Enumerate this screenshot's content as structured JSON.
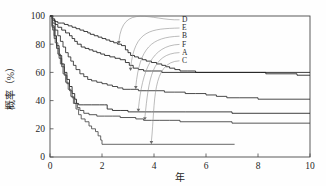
{
  "chart_data": {
    "type": "line",
    "title": "",
    "subtitle": "",
    "xlabel": "年",
    "ylabel": "概率（%）",
    "xlim": [
      0,
      10
    ],
    "ylim": [
      0,
      100
    ],
    "xticks": [
      0,
      2,
      4,
      6,
      8,
      10
    ],
    "yticks": [
      0,
      20,
      40,
      60,
      80,
      100
    ],
    "xtick_labels": [
      "0",
      "2",
      "4",
      "6",
      "8",
      "10"
    ],
    "ytick_labels": [
      "0",
      "20",
      "40",
      "60",
      "80",
      "100"
    ],
    "grid": false,
    "legend_position": "inside-upper-right",
    "legend_style": "curved-leader-lines-to-curves",
    "legend_entries": [
      {
        "label": "D",
        "anchor_x": 2.65,
        "anchor_y": 80
      },
      {
        "label": "E",
        "anchor_x": 3.1,
        "anchor_y": 61
      },
      {
        "label": "B",
        "anchor_x": 3.3,
        "anchor_y": 48
      },
      {
        "label": "F",
        "anchor_x": 3.4,
        "anchor_y": 32
      },
      {
        "label": "A",
        "anchor_x": 3.65,
        "anchor_y": 26
      },
      {
        "label": "C",
        "anchor_x": 3.9,
        "anchor_y": 9
      }
    ],
    "series": [
      {
        "name": "D",
        "final_value": 58,
        "points": [
          [
            0,
            100
          ],
          [
            0.08,
            98
          ],
          [
            0.18,
            96
          ],
          [
            0.3,
            95
          ],
          [
            0.45,
            95
          ],
          [
            0.55,
            94
          ],
          [
            0.7,
            93
          ],
          [
            0.85,
            92
          ],
          [
            1.0,
            91
          ],
          [
            1.15,
            90
          ],
          [
            1.3,
            89
          ],
          [
            1.45,
            88
          ],
          [
            1.55,
            87
          ],
          [
            1.7,
            86
          ],
          [
            1.85,
            85
          ],
          [
            2.0,
            84
          ],
          [
            2.15,
            83
          ],
          [
            2.3,
            82
          ],
          [
            2.45,
            81
          ],
          [
            2.6,
            80
          ],
          [
            2.75,
            79
          ],
          [
            2.9,
            76
          ],
          [
            3.0,
            74
          ],
          [
            3.1,
            72
          ],
          [
            3.25,
            71
          ],
          [
            3.4,
            70
          ],
          [
            3.55,
            69
          ],
          [
            3.7,
            68
          ],
          [
            3.9,
            67
          ],
          [
            4.1,
            66
          ],
          [
            4.3,
            65
          ],
          [
            4.45,
            64
          ],
          [
            4.6,
            63
          ],
          [
            4.8,
            62
          ],
          [
            5.0,
            61
          ],
          [
            5.3,
            61
          ],
          [
            5.6,
            60
          ],
          [
            6.0,
            60
          ],
          [
            6.5,
            60
          ],
          [
            7.0,
            60
          ],
          [
            7.5,
            60
          ],
          [
            8.1,
            60
          ],
          [
            8.3,
            59
          ],
          [
            9.0,
            59
          ],
          [
            9.5,
            58
          ],
          [
            10,
            58
          ]
        ]
      },
      {
        "name": "E",
        "final_value": 60,
        "points": [
          [
            0,
            100
          ],
          [
            0.1,
            97
          ],
          [
            0.2,
            94
          ],
          [
            0.3,
            92
          ],
          [
            0.45,
            90
          ],
          [
            0.6,
            88
          ],
          [
            0.75,
            86
          ],
          [
            0.85,
            84
          ],
          [
            0.95,
            82
          ],
          [
            1.05,
            80
          ],
          [
            1.2,
            78
          ],
          [
            1.35,
            77
          ],
          [
            1.5,
            76
          ],
          [
            1.65,
            75
          ],
          [
            1.8,
            74
          ],
          [
            1.95,
            73
          ],
          [
            2.1,
            72
          ],
          [
            2.3,
            71
          ],
          [
            2.5,
            70
          ],
          [
            2.7,
            69
          ],
          [
            2.9,
            67
          ],
          [
            3.05,
            65
          ],
          [
            3.2,
            63
          ],
          [
            3.4,
            62
          ],
          [
            3.6,
            61
          ],
          [
            3.9,
            61
          ],
          [
            4.3,
            60
          ],
          [
            5.0,
            60
          ],
          [
            6.0,
            60
          ],
          [
            7.0,
            60
          ],
          [
            8.0,
            60
          ],
          [
            9.0,
            60
          ],
          [
            10,
            60
          ]
        ]
      },
      {
        "name": "B",
        "final_value": 41,
        "points": [
          [
            0,
            100
          ],
          [
            0.1,
            95
          ],
          [
            0.2,
            90
          ],
          [
            0.3,
            86
          ],
          [
            0.4,
            82
          ],
          [
            0.5,
            78
          ],
          [
            0.6,
            74
          ],
          [
            0.7,
            71
          ],
          [
            0.8,
            68
          ],
          [
            0.9,
            65
          ],
          [
            1.0,
            62
          ],
          [
            1.15,
            59
          ],
          [
            1.3,
            57
          ],
          [
            1.45,
            55
          ],
          [
            1.6,
            54
          ],
          [
            1.8,
            53
          ],
          [
            2.0,
            52
          ],
          [
            2.2,
            51
          ],
          [
            2.4,
            50
          ],
          [
            2.6,
            49
          ],
          [
            2.8,
            48
          ],
          [
            3.1,
            48
          ],
          [
            3.4,
            47
          ],
          [
            3.7,
            47
          ],
          [
            4.0,
            47
          ],
          [
            4.4,
            46
          ],
          [
            4.8,
            46
          ],
          [
            5.2,
            45
          ],
          [
            5.6,
            45
          ],
          [
            6.0,
            44
          ],
          [
            6.4,
            43
          ],
          [
            6.8,
            42
          ],
          [
            7.3,
            42
          ],
          [
            8.0,
            41
          ],
          [
            9.0,
            41
          ],
          [
            10,
            41
          ]
        ]
      },
      {
        "name": "F",
        "final_value": 31,
        "points": [
          [
            0,
            100
          ],
          [
            0.08,
            93
          ],
          [
            0.16,
            86
          ],
          [
            0.25,
            79
          ],
          [
            0.35,
            72
          ],
          [
            0.45,
            66
          ],
          [
            0.55,
            60
          ],
          [
            0.65,
            55
          ],
          [
            0.75,
            50
          ],
          [
            0.85,
            45
          ],
          [
            0.95,
            41
          ],
          [
            1.02,
            38
          ],
          [
            1.1,
            37
          ],
          [
            1.3,
            37
          ],
          [
            1.6,
            37
          ],
          [
            1.9,
            37
          ],
          [
            2.1,
            37
          ],
          [
            2.2,
            34
          ],
          [
            2.4,
            33
          ],
          [
            2.7,
            33
          ],
          [
            3.0,
            32
          ],
          [
            3.4,
            32
          ],
          [
            3.9,
            32
          ],
          [
            4.5,
            32
          ],
          [
            5.2,
            32
          ],
          [
            6.0,
            32
          ],
          [
            7.0,
            31
          ],
          [
            8.0,
            31
          ],
          [
            9.0,
            31
          ],
          [
            10,
            31
          ]
        ]
      },
      {
        "name": "A",
        "final_value": 24,
        "points": [
          [
            0,
            100
          ],
          [
            0.08,
            92
          ],
          [
            0.16,
            84
          ],
          [
            0.25,
            77
          ],
          [
            0.35,
            70
          ],
          [
            0.45,
            64
          ],
          [
            0.55,
            58
          ],
          [
            0.65,
            52
          ],
          [
            0.75,
            47
          ],
          [
            0.85,
            42
          ],
          [
            0.95,
            38
          ],
          [
            1.05,
            35
          ],
          [
            1.15,
            33
          ],
          [
            1.3,
            31
          ],
          [
            1.5,
            30
          ],
          [
            1.8,
            29
          ],
          [
            2.1,
            29
          ],
          [
            2.4,
            29
          ],
          [
            2.7,
            28
          ],
          [
            3.0,
            28
          ],
          [
            3.3,
            27
          ],
          [
            3.6,
            26
          ],
          [
            3.9,
            26
          ],
          [
            4.2,
            26
          ],
          [
            4.6,
            26
          ],
          [
            5.0,
            25
          ],
          [
            5.5,
            25
          ],
          [
            6.0,
            25
          ],
          [
            6.5,
            25
          ],
          [
            7.0,
            24
          ],
          [
            8.0,
            24
          ],
          [
            9.0,
            24
          ],
          [
            10,
            24
          ]
        ]
      },
      {
        "name": "C",
        "final_value": 9,
        "truncated_at_x": 7.1,
        "points": [
          [
            0,
            100
          ],
          [
            0.1,
            90
          ],
          [
            0.2,
            81
          ],
          [
            0.3,
            73
          ],
          [
            0.4,
            66
          ],
          [
            0.5,
            59
          ],
          [
            0.6,
            53
          ],
          [
            0.7,
            48
          ],
          [
            0.8,
            43
          ],
          [
            0.9,
            38
          ],
          [
            1.0,
            34
          ],
          [
            1.1,
            30
          ],
          [
            1.2,
            27
          ],
          [
            1.35,
            25
          ],
          [
            1.5,
            22
          ],
          [
            1.6,
            20
          ],
          [
            1.75,
            18
          ],
          [
            1.85,
            15
          ],
          [
            1.95,
            12
          ],
          [
            2.0,
            9
          ],
          [
            2.5,
            9
          ],
          [
            3.0,
            9
          ],
          [
            3.5,
            9
          ],
          [
            4.0,
            9
          ],
          [
            5.0,
            9
          ],
          [
            6.0,
            9
          ],
          [
            7.1,
            9
          ]
        ]
      }
    ],
    "series_colors": {
      "D": "#1c1c1c",
      "E": "#1c1c1c",
      "B": "#2b2b2b",
      "F": "#1c1c1c",
      "A": "#3a3a3a",
      "C": "#4a4a4a"
    }
  }
}
